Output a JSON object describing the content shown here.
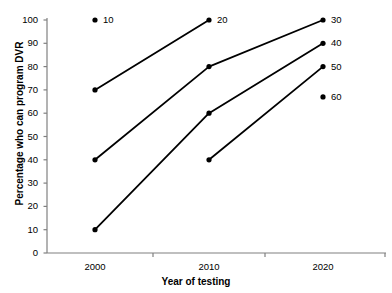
{
  "chart_data": {
    "type": "line",
    "title": "",
    "xlabel": "Year of testing",
    "ylabel": "Percentage who can program DVR",
    "x": [
      2000,
      2010,
      2020
    ],
    "xtick_labels": [
      "2000",
      "2010",
      "2020"
    ],
    "ytick_labels": [
      "0",
      "10",
      "20",
      "30",
      "40",
      "50",
      "60",
      "70",
      "80",
      "90",
      "100"
    ],
    "ytick_values": [
      0,
      10,
      20,
      30,
      40,
      50,
      60,
      70,
      80,
      90,
      100
    ],
    "ylim": [
      0,
      100
    ],
    "xlim": [
      1995,
      2026
    ],
    "grid": false,
    "legend": false,
    "marker": "filled-circle",
    "line_color": "#000000",
    "marker_color": "#000000",
    "axis_color": "#808080",
    "series": [
      {
        "name": "10",
        "points": [],
        "annotation_only": true,
        "annotation_x": 2000,
        "annotation_y": 100
      },
      {
        "name": "20",
        "points": [
          {
            "x": 2000,
            "y": 70
          },
          {
            "x": 2010,
            "y": 100
          }
        ]
      },
      {
        "name": "30",
        "points": [
          {
            "x": 2000,
            "y": 40
          },
          {
            "x": 2010,
            "y": 80
          },
          {
            "x": 2020,
            "y": 100
          }
        ]
      },
      {
        "name": "40",
        "points": [
          {
            "x": 2000,
            "y": 10
          },
          {
            "x": 2010,
            "y": 60
          },
          {
            "x": 2020,
            "y": 90
          }
        ]
      },
      {
        "name": "50",
        "points": [
          {
            "x": 2010,
            "y": 40
          },
          {
            "x": 2020,
            "y": 80
          }
        ]
      },
      {
        "name": "60",
        "points": [],
        "annotation_only": true,
        "annotation_x": 2020,
        "annotation_y": 67
      }
    ],
    "point_labels": [
      {
        "text": "10",
        "x": 2000,
        "y": 100
      },
      {
        "text": "20",
        "x": 2010,
        "y": 100
      },
      {
        "text": "30",
        "x": 2020,
        "y": 100
      },
      {
        "text": "40",
        "x": 2020,
        "y": 90
      },
      {
        "text": "50",
        "x": 2020,
        "y": 80
      },
      {
        "text": "60",
        "x": 2020,
        "y": 67
      }
    ]
  }
}
